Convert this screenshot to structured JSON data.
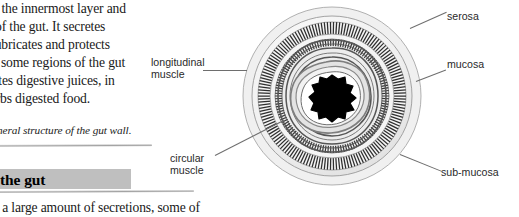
{
  "article": {
    "body_lines": [
      "s the innermost layer and",
      "of the gut. It secretes",
      "lubricates and protects",
      "n some regions of the gut",
      "retes digestive juices, in",
      "orbs digested food."
    ],
    "figure_caption": "eneral structure of the gut wall.",
    "section_heading": "the gut",
    "continuation_line": "e a large amount of secretions, some of"
  },
  "figure": {
    "labels": {
      "longitudinal_muscle": "longitudinal\nmuscle",
      "circular_muscle": "circular\nmuscle",
      "serosa": "serosa",
      "mucosa": "mucosa",
      "sub_mucosa": "sub-mucosa"
    },
    "colors": {
      "lumen": "#000000",
      "stripe": "#3a3a3a",
      "ring_light": "#ebebeb",
      "ring_mid": "#d8d8d8",
      "outline": "#8c8c8c",
      "leader_line": "#6e6e6e",
      "heading_highlight": "#bfbfbf"
    }
  }
}
